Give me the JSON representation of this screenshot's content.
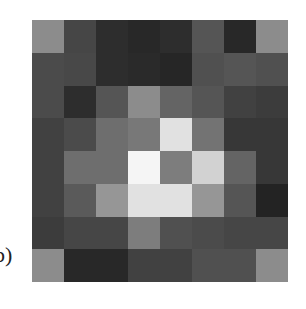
{
  "figure": {
    "panel_label": "b)",
    "grid_size": [
      8,
      8
    ]
  },
  "chart_data": {
    "type": "heatmap",
    "title": "",
    "xlabel": "",
    "ylabel": "",
    "colormap": "grayscale",
    "value_range": [
      0,
      255
    ],
    "rows": 8,
    "cols": 8,
    "values": [
      [
        140,
        70,
        45,
        40,
        45,
        85,
        40,
        140
      ],
      [
        75,
        72,
        45,
        42,
        38,
        80,
        85,
        80
      ],
      [
        75,
        45,
        85,
        140,
        100,
        85,
        65,
        60
      ],
      [
        65,
        75,
        110,
        120,
        225,
        115,
        55,
        55
      ],
      [
        65,
        110,
        110,
        245,
        125,
        210,
        100,
        55
      ],
      [
        65,
        90,
        150,
        225,
        225,
        150,
        85,
        35
      ],
      [
        60,
        70,
        70,
        125,
        80,
        75,
        70,
        70
      ],
      [
        140,
        40,
        40,
        65,
        65,
        80,
        80,
        140
      ]
    ]
  }
}
